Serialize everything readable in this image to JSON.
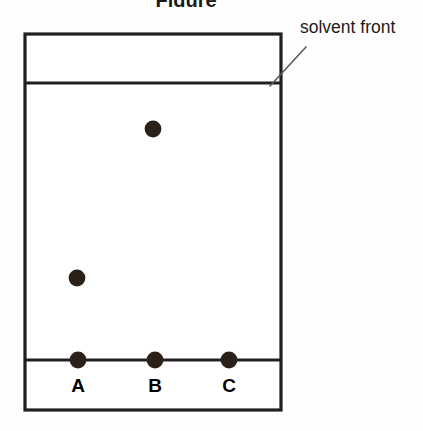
{
  "figure": {
    "title_clipped": "Figure",
    "background_color": "#fefefe",
    "width": 423,
    "height": 431
  },
  "plate": {
    "name": "tlc-plate",
    "ink_color": "#231f20",
    "fill_color": "#ffffff",
    "left": 25,
    "top": 34,
    "right": 281,
    "bottom": 410
  },
  "annotations": {
    "solvent_front_label": "solvent front",
    "solvent_front_label_x": 300,
    "solvent_front_label_y": 34,
    "leader_color": "#58595b"
  },
  "lines": {
    "solvent_front_y": 83,
    "baseline_y": 360
  },
  "lanes": [
    {
      "label": "A",
      "x": 78,
      "label_y": 392,
      "spots": [
        {
          "name": "origin-spot-a",
          "y": 360,
          "r": 8.4
        },
        {
          "name": "developed-spot-a",
          "y": 278,
          "r": 8.4
        }
      ]
    },
    {
      "label": "B",
      "x": 155,
      "label_y": 392,
      "spots": [
        {
          "name": "origin-spot-b",
          "y": 360,
          "r": 8.4
        },
        {
          "name": "developed-spot-b",
          "y": 129,
          "r": 8.4
        }
      ]
    },
    {
      "label": "C",
      "x": 229,
      "label_y": 392,
      "spots": [
        {
          "name": "origin-spot-c",
          "y": 360,
          "r": 8.4
        }
      ]
    }
  ],
  "spot_color": "#2b2119"
}
